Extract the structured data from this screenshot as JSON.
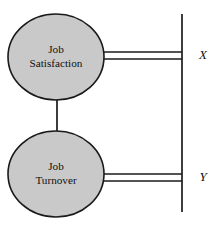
{
  "diagram": {
    "type": "path-diagram",
    "background_color": "#ffffff",
    "nodes": [
      {
        "id": "job-satisfaction",
        "label_line1": "Job",
        "label_line2": "Satisfaction",
        "shape": "ellipse",
        "fill_color": "#c9c9c9",
        "stroke_color": "#1a1a1a",
        "cx": 56,
        "cy": 57,
        "rx": 48,
        "ry": 43
      },
      {
        "id": "job-turnover",
        "label_line1": "Job",
        "label_line2": "Turnover",
        "shape": "ellipse",
        "fill_color": "#c9c9c9",
        "stroke_color": "#1a1a1a",
        "cx": 56,
        "cy": 174,
        "rx": 48,
        "ry": 43
      }
    ],
    "indicator_bar": {
      "id": "vertical-bar",
      "x": 182,
      "y_top": 14,
      "y_bottom": 212,
      "stroke_color": "#1a1a1a"
    },
    "edges": [
      {
        "id": "satisfaction-to-turnover",
        "style": "single",
        "from": "job-satisfaction",
        "to": "job-turnover",
        "x": 57,
        "y_start": 100,
        "y_end": 131
      },
      {
        "id": "satisfaction-to-bar",
        "style": "double",
        "from": "job-satisfaction",
        "to": "vertical-bar",
        "x_start": 102,
        "x_end": 182,
        "y_upper": 52,
        "y_lower": 59
      },
      {
        "id": "turnover-to-bar",
        "style": "double",
        "from": "job-turnover",
        "to": "vertical-bar",
        "x_start": 102,
        "x_end": 182,
        "y_upper": 174,
        "y_lower": 181
      }
    ],
    "axis_labels": [
      {
        "id": "label-x",
        "text": "X",
        "x": 203,
        "y": 56
      },
      {
        "id": "label-y",
        "text": "Y",
        "x": 203,
        "y": 178
      }
    ]
  }
}
